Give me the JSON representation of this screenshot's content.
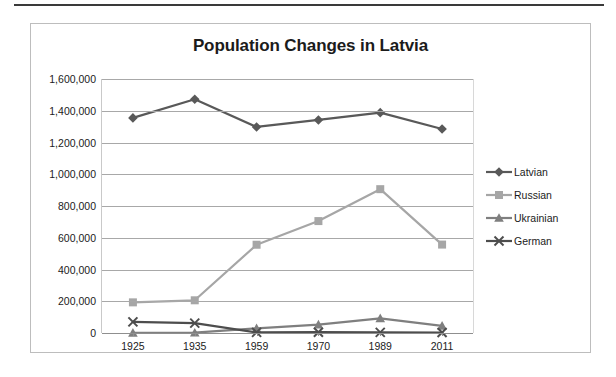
{
  "chart_data": {
    "type": "line",
    "title": "Population Changes in Latvia",
    "xlabel": "",
    "ylabel": "",
    "categories": [
      "1925",
      "1935",
      "1959",
      "1970",
      "1989",
      "2011"
    ],
    "ylim": [
      0,
      1600000
    ],
    "ytick_labels": [
      "1,600,000",
      "1,400,000",
      "1,200,000",
      "1,000,000",
      "800,000",
      "600,000",
      "400,000",
      "200,000",
      "0"
    ],
    "ytick_values": [
      1600000,
      1400000,
      1200000,
      1000000,
      800000,
      600000,
      400000,
      200000,
      0
    ],
    "grid": true,
    "legend_position": "right",
    "series": [
      {
        "name": "Latvian",
        "marker": "diamond",
        "color": "#595959",
        "values": [
          1355000,
          1472000,
          1298000,
          1342000,
          1388000,
          1285000
        ]
      },
      {
        "name": "Russian",
        "marker": "square",
        "color": "#a6a6a6",
        "values": [
          193000,
          206000,
          556000,
          705000,
          906000,
          557000
        ]
      },
      {
        "name": "Ukrainian",
        "marker": "triangle",
        "color": "#7f7f7f",
        "values": [
          1000,
          1800,
          29000,
          53000,
          92000,
          45000
        ]
      },
      {
        "name": "German",
        "marker": "x",
        "color": "#4d4d4d",
        "values": [
          70000,
          62000,
          4000,
          5000,
          3700,
          3000
        ]
      }
    ]
  }
}
